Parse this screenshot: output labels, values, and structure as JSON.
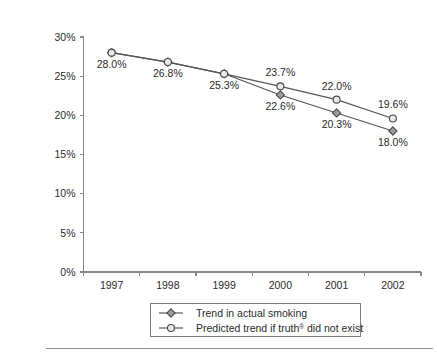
{
  "chart_data": {
    "type": "line",
    "title": "",
    "subtitle": "",
    "xlabel": "",
    "ylabel": "",
    "categories": [
      "1997",
      "1998",
      "1999",
      "2000",
      "2001",
      "2002"
    ],
    "x": [
      1997,
      1998,
      1999,
      2000,
      2001,
      2002
    ],
    "series": [
      {
        "name": "Trend in actual smoking",
        "marker": "filled-diamond",
        "values": [
          28.0,
          26.8,
          25.3,
          22.6,
          20.3,
          18.0
        ],
        "labels": [
          "28.0%",
          "26.8%",
          "25.3%",
          "22.6%",
          "20.3%",
          "18.0%"
        ],
        "label_positions": [
          "below",
          "below",
          "below",
          "below",
          "below",
          "below"
        ]
      },
      {
        "name": "Predicted trend if truth® did not exist",
        "marker": "open-circle",
        "values": [
          28.0,
          26.8,
          25.3,
          23.7,
          22.0,
          19.6
        ],
        "labels": [
          "28.0%",
          "26.8%",
          "25.3%",
          "23.7%",
          "22.0%",
          "19.6%"
        ],
        "label_positions": [
          "below",
          "below",
          "below",
          "above",
          "above",
          "above"
        ]
      }
    ],
    "ylim": [
      0,
      30
    ],
    "ytick_values": [
      0,
      5,
      10,
      15,
      20,
      25,
      30
    ],
    "ytick_labels": [
      "0%",
      "5%",
      "10%",
      "15%",
      "20%",
      "25%",
      "30%"
    ],
    "xtick_labels": [
      "1997",
      "1998",
      "1999",
      "2000",
      "2001",
      "2002"
    ],
    "grid": false,
    "legend_position": "bottom",
    "colors": {
      "line": "#555555",
      "axis": "#868686",
      "text": "#2b2b2b",
      "marker_actual_fill": "#9d9d9d",
      "marker_predicted_fill": "#e8e8e8",
      "marker_edge": "#4a4a4a",
      "legend_border": "#7d7d7d",
      "background": "#ffffff"
    }
  },
  "legend": {
    "items": [
      {
        "label": "Trend in actual smoking",
        "label_pre": "Trend in actual smoking",
        "label_sup": "",
        "label_post": "",
        "marker": "filled-diamond"
      },
      {
        "label": "Predicted trend if truth® did not exist",
        "label_pre": "Predicted trend if truth",
        "label_sup": "®",
        "label_post": " did not exist",
        "marker": "open-circle"
      }
    ]
  },
  "axes": {
    "y_ticks": [
      {
        "label": "30%",
        "value": 30
      },
      {
        "label": "25%",
        "value": 25
      },
      {
        "label": "20%",
        "value": 20
      },
      {
        "label": "15%",
        "value": 15
      },
      {
        "label": "10%",
        "value": 10
      },
      {
        "label": "5%",
        "value": 5
      },
      {
        "label": "0%",
        "value": 0
      }
    ],
    "x_ticks": [
      {
        "label": "1997"
      },
      {
        "label": "1998"
      },
      {
        "label": "1999"
      },
      {
        "label": "2000"
      },
      {
        "label": "2001"
      },
      {
        "label": "2002"
      }
    ]
  },
  "point_labels": {
    "actual": [
      "28.0%",
      "26.8%",
      "25.3%",
      "22.6%",
      "20.3%",
      "18.0%"
    ],
    "predicted": [
      "28.0%",
      "26.8%",
      "25.3%",
      "23.7%",
      "22.0%",
      "19.6%"
    ]
  }
}
